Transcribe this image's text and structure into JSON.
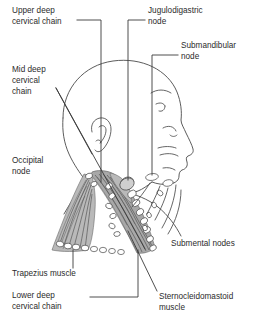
{
  "figure": {
    "background_color": "#ffffff",
    "line_color": "#4a4a4a",
    "text_color": "#2b2b2b",
    "muscle_fill": "#b9b9b9",
    "node_fill": "#ffffff"
  },
  "labels": {
    "upper_deep_cervical_chain": "Upper deep\ncervical chain",
    "upper_deep_cervical_chain_l1": "Upper deep",
    "upper_deep_cervical_chain_l2": "cervical chain",
    "jugulodigastric_node_l1": "Jugulodigastric",
    "jugulodigastric_node_l2": "node",
    "submandibular_node_l1": "Submandibular",
    "submandibular_node_l2": "node",
    "mid_deep_cervical_chain_l1": "Mid deep",
    "mid_deep_cervical_chain_l2": "cervical",
    "mid_deep_cervical_chain_l3": "chain",
    "occipital_node_l1": "Occipital",
    "occipital_node_l2": "node",
    "submental_nodes": "Submental nodes",
    "trapezius_muscle": "Trapezius muscle",
    "lower_deep_cervical_chain_l1": "Lower deep",
    "lower_deep_cervical_chain_l2": "cervical chain",
    "sternocleidomastoid_muscle_l1": "Sternocleidomastoid",
    "sternocleidomastoid_muscle_l2": "muscle"
  },
  "annotations": [
    {
      "name": "upper-deep-cervical-chain",
      "position": "top-left"
    },
    {
      "name": "jugulodigastric-node",
      "position": "top-right"
    },
    {
      "name": "submandibular-node",
      "position": "upper-right"
    },
    {
      "name": "mid-deep-cervical-chain",
      "position": "mid-left"
    },
    {
      "name": "occipital-node",
      "position": "mid-left"
    },
    {
      "name": "submental-nodes",
      "position": "lower-right"
    },
    {
      "name": "trapezius-muscle",
      "position": "bottom-left"
    },
    {
      "name": "lower-deep-cervical-chain",
      "position": "bottom-left"
    },
    {
      "name": "sternocleidomastoid-muscle",
      "position": "bottom-right"
    }
  ]
}
